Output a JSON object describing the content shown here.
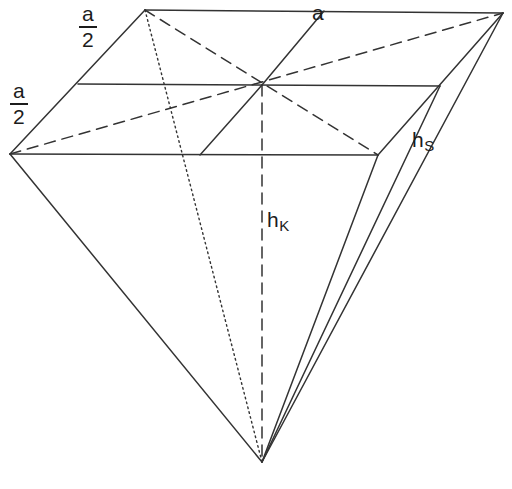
{
  "diagram": {
    "type": "geometry-sketch",
    "width": 512,
    "height": 489,
    "background_color": "#ffffff",
    "stroke_color": "#333333",
    "text_color": "#1c1c1c"
  },
  "labels": {
    "edge_a": "a",
    "half_edge_numerator": "a",
    "half_edge_denominator": "2",
    "height_pyramid_base": "h",
    "height_pyramid_sub": "K",
    "height_slant_base": "h",
    "height_slant_sub": "S"
  },
  "geometry": {
    "base_quad": {
      "top_left": [
        145,
        10
      ],
      "top_right": [
        503,
        13
      ],
      "bottom_right": [
        378,
        155
      ],
      "bottom_left": [
        10,
        154
      ]
    },
    "center": [
      262,
      85
    ],
    "apex": [
      262,
      462
    ],
    "midpoints": {
      "top_edge": [
        324,
        11
      ],
      "right_edge": [
        440,
        84
      ],
      "bottom_edge": [
        194,
        155
      ],
      "left_edge": [
        78,
        82
      ]
    },
    "lines": [
      {
        "name": "base-edge-top",
        "style": "solid",
        "from": [
          145,
          10
        ],
        "to": [
          503,
          13
        ]
      },
      {
        "name": "base-edge-right",
        "style": "solid",
        "from": [
          503,
          13
        ],
        "to": [
          378,
          155
        ]
      },
      {
        "name": "base-edge-bottom",
        "style": "solid",
        "from": [
          378,
          155
        ],
        "to": [
          10,
          154
        ]
      },
      {
        "name": "base-edge-left",
        "style": "solid",
        "from": [
          10,
          154
        ],
        "to": [
          145,
          10
        ]
      },
      {
        "name": "midline-horizontal",
        "style": "solid",
        "from": [
          78,
          84
        ],
        "to": [
          440,
          86
        ]
      },
      {
        "name": "midline-upper-oblique",
        "style": "solid",
        "from": [
          324,
          11
        ],
        "to": [
          262,
          85
        ]
      },
      {
        "name": "midline-lower-oblique",
        "style": "solid",
        "from": [
          262,
          85
        ],
        "to": [
          200,
          155
        ]
      },
      {
        "name": "base-diagonal-tl-br",
        "style": "dashed",
        "from": [
          145,
          10
        ],
        "to": [
          378,
          155
        ]
      },
      {
        "name": "base-diagonal-bl-tr",
        "style": "dashed",
        "from": [
          10,
          154
        ],
        "to": [
          503,
          13
        ]
      },
      {
        "name": "height-hk",
        "style": "dashed",
        "from": [
          262,
          85
        ],
        "to": [
          262,
          462
        ]
      },
      {
        "name": "lateral-edge-tl-apex",
        "style": "dotted",
        "from": [
          145,
          10
        ],
        "to": [
          262,
          462
        ]
      },
      {
        "name": "lateral-edge-bl-apex",
        "style": "solid",
        "from": [
          10,
          154
        ],
        "to": [
          262,
          462
        ]
      },
      {
        "name": "lateral-edge-tr-apex",
        "style": "solid",
        "from": [
          503,
          13
        ],
        "to": [
          262,
          462
        ]
      },
      {
        "name": "lateral-edge-br-apex",
        "style": "solid",
        "from": [
          378,
          155
        ],
        "to": [
          262,
          462
        ]
      },
      {
        "name": "slant-height-hs",
        "style": "solid",
        "from": [
          440,
          86
        ],
        "to": [
          262,
          462
        ]
      }
    ]
  }
}
